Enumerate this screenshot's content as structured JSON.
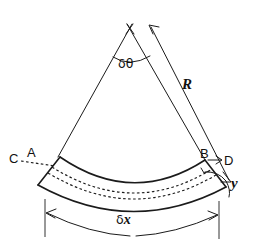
{
  "figure": {
    "kind": "engineering-diagram",
    "background_color": "#ffffff",
    "ink_color": "#1b1b1b"
  },
  "labels": {
    "point_c": "C",
    "point_a": "A",
    "point_b": "B",
    "point_d": "D",
    "distance_y": "y",
    "radius_r": "R",
    "angle_delta_theta_symbol": "δ",
    "angle_delta_theta_var": "θ",
    "length_delta_x_symbol": "δ",
    "length_delta_x_var": "x"
  },
  "geometry": {
    "apex": {
      "x": 130,
      "y": 28
    },
    "left_ray_end": {
      "x": 58,
      "y": 156
    },
    "right_ray_end": {
      "x": 205,
      "y": 159
    },
    "radius_arrow_tail": {
      "x": 231,
      "y": 182
    },
    "radius_arrow_head": {
      "x": 149,
      "y": 25
    },
    "beam_left_end_top": {
      "x": 60,
      "y": 157
    },
    "beam_left_end_bottom": {
      "x": 38,
      "y": 185
    },
    "beam_right_end_top": {
      "x": 205,
      "y": 160
    },
    "beam_right_end_bottom": {
      "x": 226,
      "y": 187
    },
    "dimension_arc_y": 222,
    "dashed_arc_count": 2
  }
}
